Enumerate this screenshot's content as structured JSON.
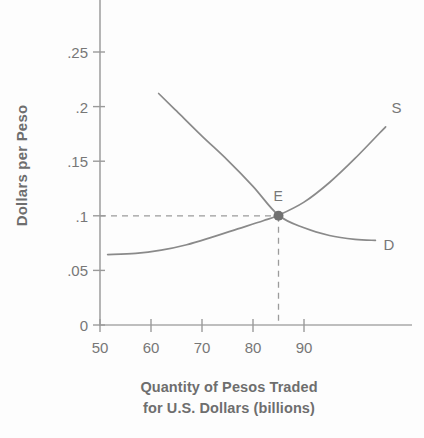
{
  "chart_data": {
    "type": "line",
    "title": "",
    "xlabel": "Quantity of Pesos Traded for U.S. Dollars (billions)",
    "xlabel_line1": "Quantity of Pesos Traded",
    "xlabel_line2": "for U.S. Dollars (billions)",
    "ylabel": "Dollars per Peso",
    "xlim": [
      50,
      110
    ],
    "ylim": [
      0,
      0.275
    ],
    "grid": false,
    "legend_position": "inline-curve-end",
    "xticks": [
      50,
      60,
      70,
      80,
      90
    ],
    "xtick_labels": [
      "50",
      "60",
      "70",
      "80",
      "90"
    ],
    "yticks": [
      0,
      0.05,
      0.1,
      0.15,
      0.2,
      0.25
    ],
    "ytick_labels": [
      "0",
      ".05",
      ".1",
      ".15",
      ".2",
      ".25"
    ],
    "series": [
      {
        "name": "Demand",
        "label": "D",
        "points": [
          {
            "x": 61.5,
            "y": 0.212
          },
          {
            "x": 65,
            "y": 0.196
          },
          {
            "x": 70,
            "y": 0.173
          },
          {
            "x": 75,
            "y": 0.151
          },
          {
            "x": 80,
            "y": 0.127
          },
          {
            "x": 85,
            "y": 0.1005
          },
          {
            "x": 90,
            "y": 0.089
          },
          {
            "x": 95,
            "y": 0.082
          },
          {
            "x": 100,
            "y": 0.0785
          },
          {
            "x": 104,
            "y": 0.0775
          }
        ]
      },
      {
        "name": "Supply",
        "label": "S",
        "points": [
          {
            "x": 51.5,
            "y": 0.0645
          },
          {
            "x": 57,
            "y": 0.0655
          },
          {
            "x": 62,
            "y": 0.0685
          },
          {
            "x": 67,
            "y": 0.0735
          },
          {
            "x": 72,
            "y": 0.0805
          },
          {
            "x": 77,
            "y": 0.088
          },
          {
            "x": 82,
            "y": 0.0955
          },
          {
            "x": 85,
            "y": 0.1005
          },
          {
            "x": 90,
            "y": 0.1125
          },
          {
            "x": 95,
            "y": 0.1305
          },
          {
            "x": 100,
            "y": 0.1525
          },
          {
            "x": 106,
            "y": 0.1815
          }
        ]
      }
    ],
    "annotations": [
      {
        "name": "equilibrium",
        "label": "E",
        "x": 85,
        "y": 0.1,
        "marker": "filled-circle",
        "guides": [
          "horizontal-dashed-to-y-axis",
          "vertical-dashed-to-x-axis"
        ]
      }
    ],
    "colors": {
      "curve": "#8a8a8a",
      "axis": "#9a9a9a",
      "text": "#6e6e6e",
      "marker": "#707070",
      "dashed_guide": "#9b9b9b",
      "background": "#fdfdfd"
    }
  }
}
